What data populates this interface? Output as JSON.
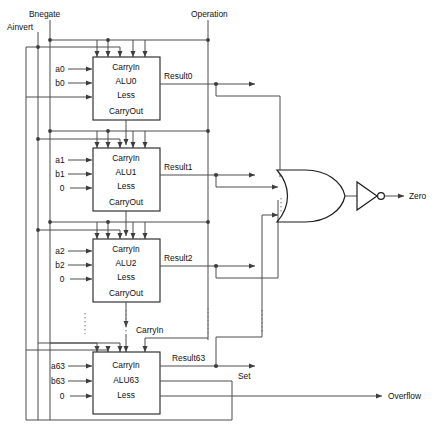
{
  "figure": {
    "control_inputs": [
      {
        "id": "bnegate",
        "label": "Bnegate"
      },
      {
        "id": "ainvert",
        "label": "Ainvert"
      },
      {
        "id": "operation",
        "label": "Operation"
      }
    ],
    "internal_labels": {
      "carryin_bus": "CarryIn"
    },
    "outputs": [
      {
        "id": "zero",
        "label": "Zero"
      },
      {
        "id": "set",
        "label": "Set"
      },
      {
        "id": "overflow",
        "label": "Overflow"
      }
    ],
    "caption": ""
  },
  "alus": [
    {
      "id": "alu0",
      "name": "ALU0",
      "ports": [
        "CarryIn",
        "ALU0",
        "Less",
        "CarryOut"
      ],
      "inputs": [
        {
          "label": "a0"
        },
        {
          "label": "b0"
        },
        {
          "label": ""
        }
      ],
      "result_label": "Result0"
    },
    {
      "id": "alu1",
      "name": "ALU1",
      "ports": [
        "CarryIn",
        "ALU1",
        "Less",
        "CarryOut"
      ],
      "inputs": [
        {
          "label": "a1"
        },
        {
          "label": "b1"
        },
        {
          "label": "0"
        }
      ],
      "result_label": "Result1"
    },
    {
      "id": "alu2",
      "name": "ALU2",
      "ports": [
        "CarryIn",
        "ALU2",
        "Less",
        "CarryOut"
      ],
      "inputs": [
        {
          "label": "a2"
        },
        {
          "label": "b2"
        },
        {
          "label": "0"
        }
      ],
      "result_label": "Result2"
    },
    {
      "id": "alu63",
      "name": "ALU63",
      "ports": [
        "CarryIn",
        "ALU63",
        "Less"
      ],
      "inputs": [
        {
          "label": "a63"
        },
        {
          "label": "b63"
        },
        {
          "label": "0"
        }
      ],
      "result_label": "Result63"
    }
  ],
  "gates": [
    {
      "id": "or-gate",
      "type": "or",
      "name": "NOR-or-stage"
    },
    {
      "id": "inverter",
      "type": "not",
      "name": "inverter"
    }
  ],
  "colors": {
    "wire": "#4c4c4c",
    "box_stroke": "#2b2b2b",
    "text": "#111111",
    "background": "#ffffff"
  }
}
